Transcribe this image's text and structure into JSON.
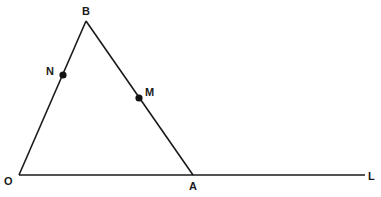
{
  "diagram": {
    "type": "geometry",
    "stroke_color": "#1a1a1a",
    "points": {
      "O": {
        "label": "O",
        "x": 19,
        "y": 175
      },
      "A": {
        "label": "A",
        "x": 193,
        "y": 175
      },
      "B": {
        "label": "B",
        "x": 86,
        "y": 21
      },
      "L": {
        "label": "L",
        "x": 365,
        "y": 175
      },
      "N": {
        "label": "N",
        "x": 63,
        "y": 75
      },
      "M": {
        "label": "M",
        "x": 139,
        "y": 98
      }
    },
    "segments": [
      {
        "from": "O",
        "to": "B"
      },
      {
        "from": "B",
        "to": "A"
      },
      {
        "from": "O",
        "to": "L"
      }
    ],
    "marked_points": [
      "N",
      "M"
    ],
    "labels": {
      "B": "B",
      "N": "N",
      "M": "M",
      "O": "O",
      "A": "A",
      "L": "L"
    }
  }
}
